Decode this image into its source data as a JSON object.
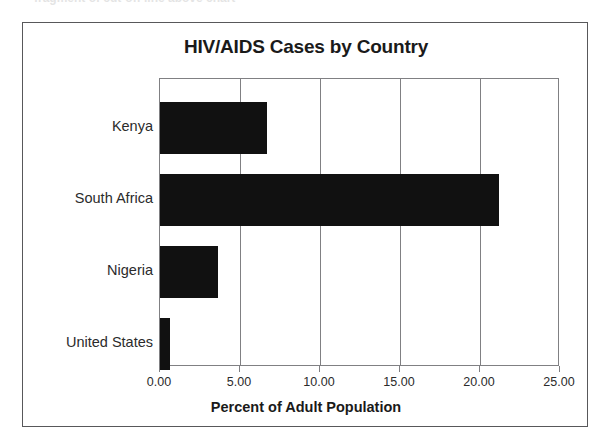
{
  "scan_artifact": {
    "top_cut_text": "fragment of cut-off line above chart"
  },
  "chart_data": {
    "type": "bar",
    "orientation": "horizontal",
    "title": "HIV/AIDS Cases by Country",
    "xlabel": "Percent of Adult Population",
    "ylabel": "",
    "categories": [
      "Kenya",
      "South Africa",
      "Nigeria",
      "United States"
    ],
    "values": [
      6.7,
      21.2,
      3.6,
      0.6
    ],
    "series": [
      {
        "name": "Percent of Adult Population",
        "values": [
          6.7,
          21.2,
          3.6,
          0.6
        ]
      }
    ],
    "xlim": [
      0,
      25
    ],
    "xticks": [
      0,
      5,
      10,
      15,
      20,
      25
    ],
    "xtick_labels": [
      "0.00",
      "5.00",
      "10.00",
      "15.00",
      "20.00",
      "25.00"
    ],
    "grid": "vertical",
    "legend": "none",
    "bar_color": "#111111",
    "frame_color": "#58585a",
    "axis_color": "#808083",
    "background": "#ffffff"
  }
}
